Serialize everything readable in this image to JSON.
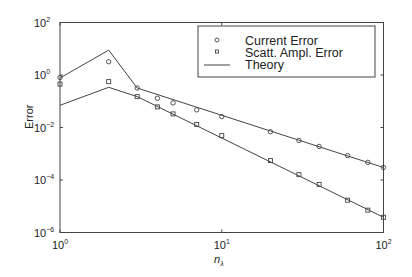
{
  "chart_data": {
    "type": "line",
    "title": "",
    "xlabel": "n_λ",
    "ylabel": "Error",
    "xscale": "log",
    "yscale": "log",
    "xlim": [
      1,
      100
    ],
    "ylim": [
      1e-06,
      100
    ],
    "grid": false,
    "legend_position": "upper right",
    "x_ticks": [
      {
        "value": 1,
        "base": "10",
        "exp": "0"
      },
      {
        "value": 10,
        "base": "10",
        "exp": "1"
      },
      {
        "value": 100,
        "base": "10",
        "exp": "2"
      }
    ],
    "y_ticks": [
      {
        "value": 100,
        "base": "10",
        "exp": "2"
      },
      {
        "value": 1,
        "base": "10",
        "exp": "0"
      },
      {
        "value": 0.01,
        "base": "10",
        "exp": "−2"
      },
      {
        "value": 0.0001,
        "base": "10",
        "exp": "−4"
      },
      {
        "value": 1e-06,
        "base": "10",
        "exp": "−6"
      }
    ],
    "series": [
      {
        "name": "Current Error",
        "marker": "circle",
        "line": false,
        "x": [
          1,
          2,
          3,
          4,
          5,
          7,
          10,
          20,
          30,
          40,
          60,
          80,
          100
        ],
        "y": [
          0.8,
          3.2,
          0.32,
          0.13,
          0.087,
          0.047,
          0.026,
          0.0069,
          0.0032,
          0.0019,
          0.00085,
          0.00047,
          0.0003
        ]
      },
      {
        "name": "Scatt. Ampl. Error",
        "marker": "square",
        "line": false,
        "x": [
          1,
          2,
          3,
          4,
          5,
          7,
          10,
          20,
          30,
          40,
          60,
          80,
          100
        ],
        "y": [
          0.45,
          0.56,
          0.15,
          0.061,
          0.033,
          0.013,
          0.0049,
          0.00055,
          0.00016,
          6.8e-05,
          1.7e-05,
          7.1e-06,
          3.8e-06
        ]
      },
      {
        "name": "Theory",
        "marker": "none",
        "line": true,
        "segments": [
          {
            "x": [
              1,
              2,
              3,
              100
            ],
            "y": [
              0.77,
              8.9,
              0.32,
              0.0003
            ]
          },
          {
            "x": [
              1,
              2,
              3,
              100
            ],
            "y": [
              0.07,
              0.34,
              0.15,
              3.8e-06
            ]
          }
        ]
      }
    ]
  },
  "legend": {
    "items": [
      {
        "label": "Current Error",
        "symbol": "circle"
      },
      {
        "label": "Scatt. Ampl. Error",
        "symbol": "square"
      },
      {
        "label": "Theory",
        "symbol": "line"
      }
    ]
  }
}
